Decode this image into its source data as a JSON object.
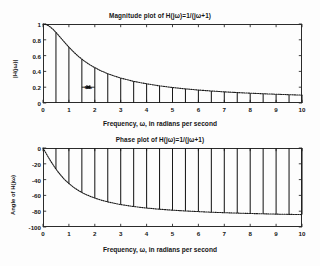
{
  "figure": {
    "background": "#fdfdfd",
    "axis_color": "#2b2b2b",
    "curve_color": "#1a1a1a",
    "stem_color": "#1a1a1a"
  },
  "chart_data": [
    {
      "type": "line",
      "name": "magnitude-plot",
      "title": "Magnitude plot of H(jω)=1/(jω+1)",
      "xlabel": "Frequency, ω, in radians per second",
      "ylabel": "|H(jω)|",
      "xlim": [
        0,
        10
      ],
      "ylim": [
        0,
        1
      ],
      "grid": false,
      "legend": null,
      "xticks": [
        0,
        1,
        2,
        3,
        4,
        5,
        6,
        7,
        8,
        9,
        10
      ],
      "xticklabels": [
        "0",
        "1",
        "2",
        "3",
        "4",
        "5",
        "6",
        "7",
        "8",
        "9",
        "10"
      ],
      "yticks": [
        0,
        0.2,
        0.4,
        0.6,
        0.8,
        1
      ],
      "yticklabels": [
        "0",
        "0.2",
        "0.4",
        "0.6",
        "0.8",
        "1"
      ],
      "curve": {
        "label": "|H(jω)| = 1/sqrt(1+ω^2)",
        "style": "dotted",
        "x": [
          0,
          0.1,
          0.2,
          0.3,
          0.4,
          0.5,
          0.6,
          0.7,
          0.8,
          0.9,
          1,
          1.2,
          1.4,
          1.6,
          1.8,
          2,
          2.25,
          2.5,
          2.75,
          3,
          3.5,
          4,
          4.5,
          5,
          5.5,
          6,
          6.5,
          7,
          7.5,
          8,
          8.5,
          9,
          9.5,
          10
        ],
        "y": [
          1,
          0.995,
          0.981,
          0.958,
          0.928,
          0.894,
          0.857,
          0.819,
          0.781,
          0.743,
          0.707,
          0.64,
          0.581,
          0.53,
          0.486,
          0.447,
          0.406,
          0.371,
          0.342,
          0.316,
          0.274,
          0.243,
          0.217,
          0.196,
          0.179,
          0.164,
          0.152,
          0.141,
          0.132,
          0.124,
          0.117,
          0.111,
          0.105,
          0.0995
        ]
      },
      "stems": {
        "label": "samples at ω = kω₀",
        "x": [
          0.5,
          1,
          1.5,
          2,
          2.5,
          3,
          3.5,
          4,
          4.5,
          5,
          5.5,
          6,
          6.5,
          7,
          7.5,
          8,
          8.5,
          9,
          9.5,
          10
        ],
        "y": [
          0.894,
          0.707,
          0.555,
          0.447,
          0.371,
          0.316,
          0.274,
          0.243,
          0.217,
          0.196,
          0.179,
          0.164,
          0.152,
          0.141,
          0.132,
          0.124,
          0.117,
          0.111,
          0.105,
          0.0995
        ]
      },
      "annotation": {
        "text": "ω₀",
        "x_from": 1.5,
        "x_to": 2,
        "y": 0.2,
        "style": "double-arrow-inward"
      }
    },
    {
      "type": "line",
      "name": "phase-plot",
      "title": "Phase plot of H(jω)=1/(jω+1)",
      "xlabel": "Frequency, ω, in radians per second",
      "ylabel": "Angle of H(jω)",
      "xlim": [
        0,
        10
      ],
      "ylim": [
        -100,
        0
      ],
      "grid": false,
      "legend": null,
      "xticks": [
        0,
        1,
        2,
        3,
        4,
        5,
        6,
        7,
        8,
        9,
        10
      ],
      "xticklabels": [
        "0",
        "1",
        "2",
        "3",
        "4",
        "5",
        "6",
        "7",
        "8",
        "9",
        "10"
      ],
      "yticks": [
        0,
        -20,
        -40,
        -60,
        -80,
        -100
      ],
      "yticklabels": [
        "0",
        "-20",
        "-40",
        "-60",
        "-80",
        "-100"
      ],
      "curve": {
        "label": "angle H(jω) = -atan(ω)",
        "style": "dotted",
        "x": [
          0,
          0.1,
          0.2,
          0.3,
          0.4,
          0.5,
          0.6,
          0.7,
          0.8,
          0.9,
          1,
          1.2,
          1.4,
          1.6,
          1.8,
          2,
          2.25,
          2.5,
          2.75,
          3,
          3.5,
          4,
          4.5,
          5,
          5.5,
          6,
          6.5,
          7,
          7.5,
          8,
          8.5,
          9,
          9.5,
          10
        ],
        "y": [
          0,
          -5.7,
          -11.3,
          -16.7,
          -21.8,
          -26.6,
          -31,
          -35,
          -38.7,
          -42,
          -45,
          -50.2,
          -54.5,
          -58,
          -60.9,
          -63.4,
          -66,
          -68.2,
          -70,
          -71.6,
          -74.1,
          -76,
          -77.5,
          -78.7,
          -79.7,
          -80.5,
          -81.3,
          -81.9,
          -82.4,
          -82.9,
          -83.3,
          -83.7,
          -84,
          -84.3
        ]
      },
      "stems": {
        "label": "samples at ω = kω₀",
        "x": [
          0.5,
          1,
          1.5,
          2,
          2.5,
          3,
          3.5,
          4,
          4.5,
          5,
          5.5,
          6,
          6.5,
          7,
          7.5,
          8,
          8.5,
          9,
          9.5,
          10
        ],
        "y": [
          -26.6,
          -45,
          -56.3,
          -63.4,
          -68.2,
          -71.6,
          -74.1,
          -76,
          -77.5,
          -78.7,
          -79.7,
          -80.5,
          -81.3,
          -81.9,
          -82.4,
          -82.9,
          -83.3,
          -83.7,
          -84,
          -84.3
        ]
      },
      "annotation": null
    }
  ]
}
